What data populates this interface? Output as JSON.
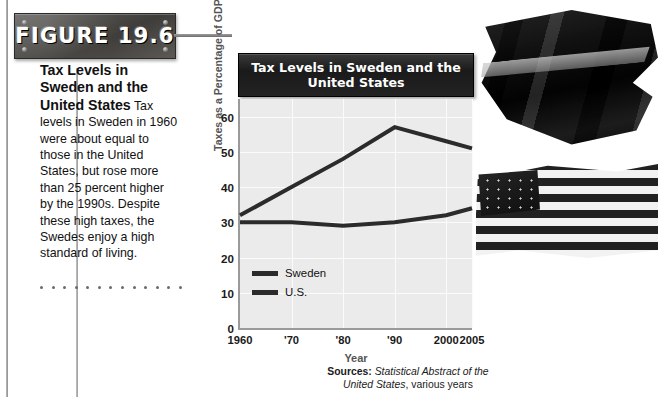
{
  "figure": {
    "label": "FIGURE 19.6"
  },
  "caption": {
    "heading": "Tax Levels in Sweden and the United States",
    "body": " Tax levels in Sweden in 1960 were about equal to those in the United States, but rose more than 25 percent higher by the 1990s. Despite these high taxes, the Swedes enjoy a high standard of living."
  },
  "sources": {
    "prefix": "Sources:",
    "italic": "Statistical Abstract of the",
    "italic2": "United States",
    "suffix": ", various years"
  },
  "photo": {
    "sweden_flag_alt": "swedish-flag",
    "usa_flag_alt": "united-states-flag"
  },
  "colors": {
    "line": "#2b2b2b",
    "plot_background": "#ebebeb",
    "gridline": "#fbfbfb",
    "title_bar": "#1a1a1a",
    "axis_title": "#555555"
  },
  "chart_data": {
    "type": "line",
    "title": "Tax Levels in Sweden and the United States",
    "xlabel": "Year",
    "ylabel": "Taxes as a Percentage of GDP",
    "x": [
      1960,
      1970,
      1980,
      1990,
      2000,
      2005
    ],
    "xtick_labels": [
      "1960",
      "'70",
      "'80",
      "'90",
      "2000",
      "2005"
    ],
    "ytick_labels": [
      "0",
      "10",
      "20",
      "30",
      "40",
      "50",
      "60"
    ],
    "yticks": [
      0,
      10,
      20,
      30,
      40,
      50,
      60
    ],
    "ylim": [
      0,
      65
    ],
    "grid": true,
    "legend_position": "inside-bottom-left",
    "series": [
      {
        "name": "Sweden",
        "values": [
          32,
          40,
          48,
          57,
          53,
          51
        ]
      },
      {
        "name": "U.S.",
        "values": [
          30,
          30,
          29,
          30,
          32,
          34
        ]
      }
    ]
  }
}
